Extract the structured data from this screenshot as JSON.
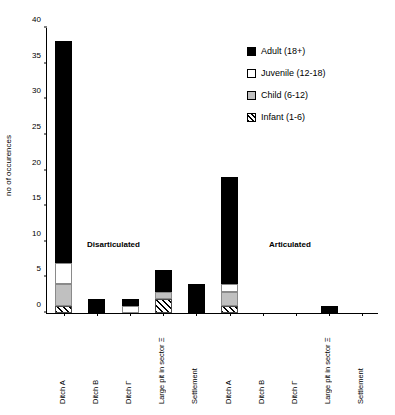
{
  "chart_data": {
    "type": "bar",
    "title": "",
    "xlabel": "",
    "ylabel": "no of occurences",
    "ylim": [
      0,
      40
    ],
    "ytick_labels": [
      "0",
      "5",
      "10",
      "15",
      "20",
      "25",
      "30",
      "35",
      "40"
    ],
    "ytick_values": [
      0,
      5,
      10,
      15,
      20,
      25,
      30,
      35,
      40
    ],
    "grid": false,
    "stacked": true,
    "legend_position": "top-right",
    "legend": [
      "Adult (18+)",
      "Juvenile (12-18)",
      "Child (6-12)",
      "Infant (1-6)"
    ],
    "colors": {
      "adult": "#000000",
      "juvenile": "#ffffff",
      "child": "#c0c0c0",
      "infant": "#ffffff"
    },
    "annotations": [
      "Disarticulated",
      "Articulated"
    ],
    "categories": [
      "Ditch A",
      "Ditch B",
      "Ditch Γ",
      "Large pit in sector Ξ",
      "Settlement",
      "Ditch A",
      "Ditch B",
      "Ditch Γ",
      "Large pit in sector Ξ",
      "Settlement"
    ],
    "groups": [
      {
        "name": "Disarticulated",
        "categories": [
          "Ditch A",
          "Ditch B",
          "Ditch Γ",
          "Large pit in sector Ξ",
          "Settlement"
        ]
      },
      {
        "name": "Articulated",
        "categories": [
          "Ditch A",
          "Ditch B",
          "Ditch Γ",
          "Large pit in sector Ξ",
          "Settlement"
        ]
      }
    ],
    "series": [
      {
        "name": "Infant (1-6)",
        "values": [
          1,
          0,
          0,
          2,
          0,
          1,
          0,
          0,
          0,
          0
        ]
      },
      {
        "name": "Child (6-12)",
        "values": [
          3,
          0,
          0,
          1,
          0,
          2,
          0,
          0,
          0,
          0
        ]
      },
      {
        "name": "Juvenile (12-18)",
        "values": [
          3,
          0,
          1,
          0,
          0,
          1,
          0,
          0,
          0,
          0
        ]
      },
      {
        "name": "Adult (18+)",
        "values": [
          31,
          2,
          1,
          3,
          4,
          15,
          0,
          0,
          1,
          0
        ]
      }
    ],
    "totals": [
      38,
      2,
      2,
      6,
      4,
      19,
      0,
      0,
      1,
      0
    ]
  }
}
